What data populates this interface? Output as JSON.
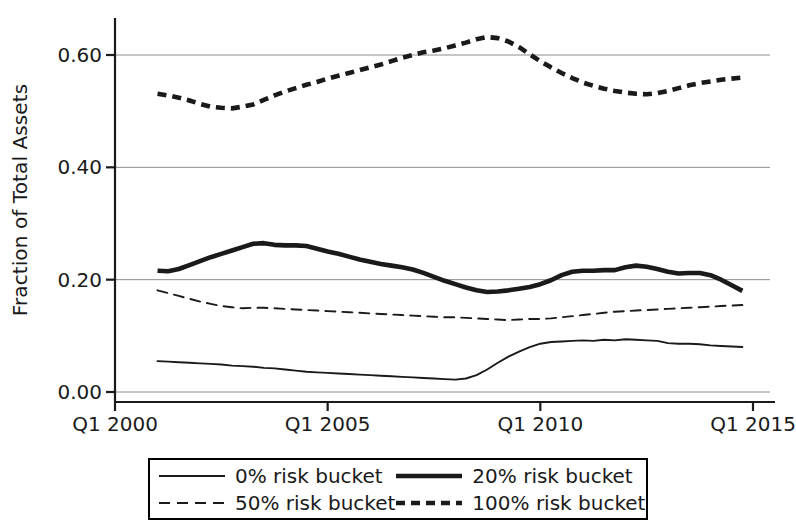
{
  "chart_data": {
    "type": "line",
    "title": "",
    "subtitle": "",
    "xlabel": "",
    "ylabel": "Fraction of Total Assets",
    "grid": true,
    "legend_position": "below-axis",
    "xlim": [
      2000.0,
      2015.0
    ],
    "ylim": [
      0.0,
      0.665
    ],
    "ytick_labels": [
      "0.00",
      "0.20",
      "0.40",
      "0.60"
    ],
    "ytick_values": [
      0.0,
      0.2,
      0.4,
      0.6
    ],
    "xtick_labels": [
      "Q1 2000",
      "Q1 2005",
      "Q1 2010",
      "Q1 2015"
    ],
    "xtick_values": [
      2000,
      2005,
      2010,
      2015
    ],
    "x": [
      2001.0,
      2001.25,
      2001.5,
      2001.75,
      2002.0,
      2002.25,
      2002.5,
      2002.75,
      2003.0,
      2003.25,
      2003.5,
      2003.75,
      2004.0,
      2004.25,
      2004.5,
      2004.75,
      2005.0,
      2005.25,
      2005.5,
      2005.75,
      2006.0,
      2006.25,
      2006.5,
      2006.75,
      2007.0,
      2007.25,
      2007.5,
      2007.75,
      2008.0,
      2008.25,
      2008.5,
      2008.75,
      2009.0,
      2009.25,
      2009.5,
      2009.75,
      2010.0,
      2010.25,
      2010.5,
      2010.75,
      2011.0,
      2011.25,
      2011.5,
      2011.75,
      2012.0,
      2012.25,
      2012.5,
      2012.75,
      2013.0,
      2013.25,
      2013.5,
      2013.75,
      2014.0,
      2014.25,
      2014.5,
      2014.75
    ],
    "series": [
      {
        "name": "0% risk bucket",
        "style": "solid",
        "width": "thin",
        "color": "#1a1a1a",
        "values": [
          0.055,
          0.054,
          0.053,
          0.052,
          0.051,
          0.05,
          0.049,
          0.047,
          0.046,
          0.045,
          0.043,
          0.042,
          0.04,
          0.038,
          0.036,
          0.035,
          0.034,
          0.033,
          0.032,
          0.031,
          0.03,
          0.029,
          0.028,
          0.027,
          0.026,
          0.025,
          0.024,
          0.023,
          0.022,
          0.024,
          0.03,
          0.04,
          0.052,
          0.063,
          0.072,
          0.08,
          0.086,
          0.089,
          0.09,
          0.091,
          0.092,
          0.091,
          0.093,
          0.092,
          0.094,
          0.093,
          0.092,
          0.091,
          0.087,
          0.086,
          0.086,
          0.085,
          0.083,
          0.082,
          0.081,
          0.08
        ]
      },
      {
        "name": "20% risk bucket",
        "style": "solid",
        "width": "thick",
        "color": "#1a1a1a",
        "values": [
          0.216,
          0.215,
          0.219,
          0.226,
          0.233,
          0.24,
          0.246,
          0.252,
          0.258,
          0.264,
          0.265,
          0.262,
          0.261,
          0.261,
          0.26,
          0.255,
          0.25,
          0.246,
          0.241,
          0.236,
          0.232,
          0.228,
          0.225,
          0.222,
          0.218,
          0.212,
          0.205,
          0.198,
          0.192,
          0.186,
          0.181,
          0.178,
          0.179,
          0.181,
          0.184,
          0.187,
          0.192,
          0.199,
          0.208,
          0.214,
          0.216,
          0.216,
          0.217,
          0.217,
          0.222,
          0.225,
          0.223,
          0.219,
          0.214,
          0.211,
          0.212,
          0.212,
          0.208,
          0.2,
          0.19,
          0.18
        ]
      },
      {
        "name": "50% risk bucket",
        "style": "dashed",
        "width": "thin",
        "color": "#1a1a1a",
        "values": [
          0.181,
          0.176,
          0.171,
          0.166,
          0.161,
          0.157,
          0.153,
          0.151,
          0.149,
          0.15,
          0.15,
          0.149,
          0.148,
          0.147,
          0.146,
          0.145,
          0.144,
          0.143,
          0.142,
          0.141,
          0.14,
          0.139,
          0.138,
          0.137,
          0.136,
          0.135,
          0.134,
          0.133,
          0.133,
          0.132,
          0.131,
          0.13,
          0.129,
          0.128,
          0.129,
          0.13,
          0.13,
          0.131,
          0.133,
          0.135,
          0.137,
          0.139,
          0.141,
          0.143,
          0.144,
          0.145,
          0.146,
          0.147,
          0.148,
          0.149,
          0.15,
          0.151,
          0.152,
          0.153,
          0.154,
          0.155
        ]
      },
      {
        "name": "100% risk bucket",
        "style": "dashed",
        "width": "thick",
        "color": "#1a1a1a",
        "values": [
          0.531,
          0.528,
          0.524,
          0.519,
          0.513,
          0.508,
          0.506,
          0.505,
          0.508,
          0.512,
          0.52,
          0.528,
          0.535,
          0.541,
          0.547,
          0.552,
          0.558,
          0.563,
          0.568,
          0.573,
          0.578,
          0.583,
          0.589,
          0.595,
          0.6,
          0.605,
          0.608,
          0.612,
          0.617,
          0.622,
          0.628,
          0.632,
          0.63,
          0.624,
          0.614,
          0.601,
          0.589,
          0.578,
          0.568,
          0.559,
          0.551,
          0.545,
          0.54,
          0.536,
          0.533,
          0.531,
          0.53,
          0.532,
          0.536,
          0.541,
          0.546,
          0.55,
          0.553,
          0.556,
          0.558,
          0.56
        ]
      }
    ]
  },
  "axes": {
    "y_label": "Fraction of Total Assets",
    "y_ticks": [
      "0.60",
      "0.40",
      "0.20",
      "0.00"
    ],
    "x_ticks": [
      "Q1 2000",
      "Q1 2005",
      "Q1 2010",
      "Q1 2015"
    ]
  },
  "legend": {
    "items": [
      {
        "label": "0% risk bucket"
      },
      {
        "label": "20% risk bucket"
      },
      {
        "label": "50% risk bucket"
      },
      {
        "label": "100% risk bucket"
      }
    ]
  }
}
